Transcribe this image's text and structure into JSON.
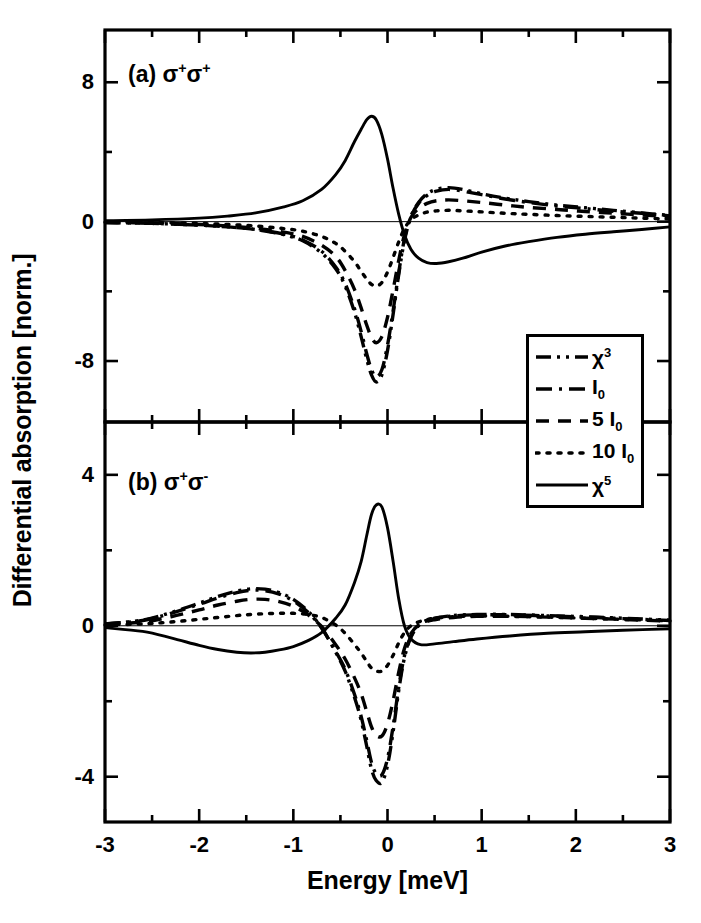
{
  "figure": {
    "ylabel": "Differential absorption [norm.]",
    "xlabel": "Energy [meV]",
    "panel_a_label_prefix": "(a) σ",
    "panel_a_sup1": "+",
    "panel_a_mid": "σ",
    "panel_a_sup2": "+",
    "panel_b_label_prefix": "(b) σ",
    "panel_b_sup1": "+",
    "panel_b_mid": "σ",
    "panel_b_sup2": "-",
    "line_color": "#000000",
    "frame_color": "#000000",
    "background": "#ffffff"
  },
  "legend": {
    "entries": [
      {
        "label_main": "χ",
        "label_sup": "3",
        "label_sub": "",
        "style": "dash-dot-dot"
      },
      {
        "label_main": "I",
        "label_sup": "",
        "label_sub": "0",
        "style": "dash-dot"
      },
      {
        "label_main": "5 I",
        "label_sup": "",
        "label_sub": "0",
        "style": "dashed"
      },
      {
        "label_main": "10 I",
        "label_sup": "",
        "label_sub": "0",
        "style": "dotted"
      },
      {
        "label_main": "χ",
        "label_sup": "5",
        "label_sub": "",
        "style": "solid"
      }
    ]
  },
  "chart_data": {
    "type": "line",
    "title": "",
    "xlabel": "Energy [meV]",
    "ylabel": "Differential absorption [norm.]",
    "xlim": [
      -3,
      3
    ],
    "xticks": [
      -3,
      -2,
      -1,
      0,
      1,
      2,
      3
    ],
    "xticklabels": [
      "-3",
      "-2",
      "-1",
      "0",
      "1",
      "2",
      "3"
    ],
    "x_minor_ticks": [
      -2.5,
      -1.5,
      -0.5,
      0.5,
      1.5,
      2.5
    ],
    "grid": false,
    "legend_position": "center-right",
    "panels": [
      {
        "id": "a",
        "label": "(a) σ+σ+",
        "ylim": [
          -11.5,
          11.0
        ],
        "yticks": [
          8,
          0,
          -8
        ],
        "yticklabels": [
          "8",
          "0",
          "-8"
        ],
        "y_minor_ticks": [
          4,
          -4
        ],
        "series": [
          {
            "name": "χ³",
            "style": "dash-dot-dot",
            "x": [
              -3.0,
              -2.5,
              -2.0,
              -1.7,
              -1.4,
              -1.1,
              -0.9,
              -0.7,
              -0.55,
              -0.45,
              -0.35,
              -0.28,
              -0.22,
              -0.17,
              -0.12,
              -0.06,
              0.0,
              0.06,
              0.12,
              0.18,
              0.25,
              0.33,
              0.42,
              0.52,
              0.65,
              0.8,
              1.0,
              1.25,
              1.5,
              1.8,
              2.1,
              2.4,
              2.7,
              3.0
            ],
            "y": [
              -0.05,
              -0.1,
              -0.2,
              -0.3,
              -0.45,
              -0.75,
              -1.1,
              -1.8,
              -2.7,
              -3.7,
              -5.2,
              -6.6,
              -7.9,
              -8.8,
              -9.2,
              -8.8,
              -7.4,
              -5.3,
              -3.0,
              -1.1,
              0.3,
              1.1,
              1.6,
              1.85,
              1.95,
              1.85,
              1.6,
              1.35,
              1.15,
              0.95,
              0.8,
              0.65,
              0.5,
              0.35
            ]
          },
          {
            "name": "I₀",
            "style": "dash-dot",
            "x": [
              -3.0,
              -2.5,
              -2.0,
              -1.7,
              -1.4,
              -1.1,
              -0.9,
              -0.7,
              -0.55,
              -0.45,
              -0.35,
              -0.28,
              -0.22,
              -0.17,
              -0.12,
              -0.06,
              0.0,
              0.06,
              0.12,
              0.18,
              0.25,
              0.33,
              0.42,
              0.52,
              0.65,
              0.8,
              1.0,
              1.25,
              1.5,
              1.8,
              2.1,
              2.4,
              2.7,
              3.0
            ],
            "y": [
              -0.05,
              -0.1,
              -0.2,
              -0.3,
              -0.45,
              -0.72,
              -1.05,
              -1.7,
              -2.6,
              -3.55,
              -5.0,
              -6.3,
              -7.6,
              -8.5,
              -8.9,
              -8.5,
              -7.1,
              -5.1,
              -2.9,
              -1.0,
              0.3,
              1.05,
              1.5,
              1.75,
              1.85,
              1.75,
              1.55,
              1.3,
              1.1,
              0.9,
              0.75,
              0.6,
              0.48,
              0.33
            ]
          },
          {
            "name": "5 I₀",
            "style": "dashed",
            "x": [
              -3.0,
              -2.5,
              -2.0,
              -1.7,
              -1.4,
              -1.1,
              -0.9,
              -0.7,
              -0.55,
              -0.45,
              -0.35,
              -0.28,
              -0.22,
              -0.17,
              -0.12,
              -0.06,
              0.0,
              0.06,
              0.12,
              0.18,
              0.25,
              0.33,
              0.42,
              0.52,
              0.65,
              0.8,
              1.0,
              1.25,
              1.5,
              1.8,
              2.1,
              2.4,
              2.7,
              3.0
            ],
            "y": [
              -0.04,
              -0.08,
              -0.16,
              -0.25,
              -0.38,
              -0.6,
              -0.85,
              -1.35,
              -2.0,
              -2.8,
              -3.9,
              -4.95,
              -5.95,
              -6.65,
              -6.95,
              -6.6,
              -5.5,
              -3.9,
              -2.2,
              -0.75,
              0.25,
              0.75,
              1.05,
              1.2,
              1.25,
              1.2,
              1.1,
              0.95,
              0.82,
              0.7,
              0.58,
              0.48,
              0.38,
              0.28
            ]
          },
          {
            "name": "10 I₀",
            "style": "dotted",
            "x": [
              -3.0,
              -2.5,
              -2.0,
              -1.7,
              -1.4,
              -1.1,
              -0.9,
              -0.7,
              -0.55,
              -0.45,
              -0.35,
              -0.28,
              -0.22,
              -0.17,
              -0.12,
              -0.06,
              0.0,
              0.06,
              0.12,
              0.18,
              0.25,
              0.33,
              0.42,
              0.52,
              0.65,
              0.8,
              1.0,
              1.25,
              1.5,
              1.8,
              2.1,
              2.4,
              2.7,
              3.0
            ],
            "y": [
              -0.03,
              -0.05,
              -0.1,
              -0.16,
              -0.25,
              -0.4,
              -0.55,
              -0.85,
              -1.25,
              -1.7,
              -2.3,
              -2.85,
              -3.3,
              -3.6,
              -3.7,
              -3.5,
              -2.9,
              -2.05,
              -1.15,
              -0.4,
              0.12,
              0.38,
              0.55,
              0.62,
              0.65,
              0.62,
              0.56,
              0.48,
              0.42,
              0.35,
              0.3,
              0.25,
              0.2,
              0.15
            ]
          },
          {
            "name": "χ⁵",
            "style": "solid",
            "x": [
              -3.0,
              -2.5,
              -2.0,
              -1.7,
              -1.4,
              -1.1,
              -0.9,
              -0.7,
              -0.55,
              -0.45,
              -0.35,
              -0.28,
              -0.22,
              -0.17,
              -0.12,
              -0.06,
              0.0,
              0.06,
              0.12,
              0.18,
              0.25,
              0.33,
              0.42,
              0.52,
              0.65,
              0.8,
              1.0,
              1.25,
              1.5,
              1.8,
              2.1,
              2.4,
              2.7,
              3.0
            ],
            "y": [
              0.05,
              0.1,
              0.2,
              0.32,
              0.5,
              0.85,
              1.2,
              1.85,
              2.7,
              3.5,
              4.6,
              5.3,
              5.85,
              6.05,
              5.85,
              5.0,
              3.6,
              1.9,
              0.4,
              -0.75,
              -1.6,
              -2.1,
              -2.35,
              -2.4,
              -2.3,
              -2.1,
              -1.75,
              -1.4,
              -1.15,
              -0.9,
              -0.72,
              -0.58,
              -0.45,
              -0.3
            ]
          }
        ]
      },
      {
        "id": "b",
        "label": "(b) σ+σ-",
        "ylim": [
          -5.2,
          5.4
        ],
        "yticks": [
          4,
          0,
          -4
        ],
        "yticklabels": [
          "4",
          "0",
          "-4"
        ],
        "y_minor_ticks": [
          2,
          -2
        ],
        "series": [
          {
            "name": "χ³",
            "style": "dash-dot-dot",
            "x": [
              -3.0,
              -2.6,
              -2.3,
              -2.0,
              -1.8,
              -1.6,
              -1.45,
              -1.3,
              -1.15,
              -1.0,
              -0.85,
              -0.7,
              -0.55,
              -0.45,
              -0.35,
              -0.28,
              -0.22,
              -0.17,
              -0.12,
              -0.06,
              0.0,
              0.06,
              0.12,
              0.18,
              0.25,
              0.35,
              0.5,
              0.7,
              0.95,
              1.3,
              1.7,
              2.1,
              2.5,
              3.0
            ],
            "y": [
              0.05,
              0.15,
              0.35,
              0.6,
              0.78,
              0.92,
              0.98,
              0.97,
              0.88,
              0.7,
              0.4,
              -0.05,
              -0.7,
              -1.2,
              -1.9,
              -2.5,
              -3.2,
              -3.8,
              -4.1,
              -4.15,
              -3.7,
              -2.8,
              -1.7,
              -0.85,
              -0.3,
              0.05,
              0.2,
              0.27,
              0.3,
              0.3,
              0.27,
              0.24,
              0.2,
              0.15
            ]
          },
          {
            "name": "I₀",
            "style": "dash-dot",
            "x": [
              -3.0,
              -2.6,
              -2.3,
              -2.0,
              -1.8,
              -1.6,
              -1.45,
              -1.3,
              -1.15,
              -1.0,
              -0.85,
              -0.7,
              -0.55,
              -0.45,
              -0.35,
              -0.28,
              -0.22,
              -0.17,
              -0.12,
              -0.06,
              0.0,
              0.06,
              0.12,
              0.18,
              0.25,
              0.35,
              0.5,
              0.7,
              0.95,
              1.3,
              1.7,
              2.1,
              2.5,
              3.0
            ],
            "y": [
              0.05,
              0.14,
              0.33,
              0.57,
              0.74,
              0.88,
              0.94,
              0.93,
              0.84,
              0.66,
              0.37,
              -0.06,
              -0.68,
              -1.15,
              -1.82,
              -2.4,
              -3.05,
              -3.62,
              -3.92,
              -3.95,
              -3.52,
              -2.66,
              -1.62,
              -0.8,
              -0.28,
              0.05,
              0.19,
              0.26,
              0.29,
              0.29,
              0.26,
              0.23,
              0.19,
              0.14
            ]
          },
          {
            "name": "5 I₀",
            "style": "dashed",
            "x": [
              -3.0,
              -2.6,
              -2.3,
              -2.0,
              -1.8,
              -1.6,
              -1.45,
              -1.3,
              -1.15,
              -1.0,
              -0.85,
              -0.7,
              -0.55,
              -0.45,
              -0.35,
              -0.28,
              -0.22,
              -0.17,
              -0.12,
              -0.06,
              0.0,
              0.06,
              0.12,
              0.18,
              0.25,
              0.35,
              0.5,
              0.7,
              0.95,
              1.3,
              1.7,
              2.1,
              2.5,
              3.0
            ],
            "y": [
              0.04,
              0.1,
              0.24,
              0.42,
              0.55,
              0.65,
              0.7,
              0.7,
              0.64,
              0.52,
              0.3,
              -0.02,
              -0.5,
              -0.88,
              -1.38,
              -1.8,
              -2.28,
              -2.68,
              -2.9,
              -2.92,
              -2.6,
              -1.98,
              -1.22,
              -0.6,
              -0.2,
              0.05,
              0.16,
              0.22,
              0.25,
              0.25,
              0.23,
              0.2,
              0.17,
              0.12
            ]
          },
          {
            "name": "10 I₀",
            "style": "dotted",
            "x": [
              -3.0,
              -2.6,
              -2.3,
              -2.0,
              -1.8,
              -1.6,
              -1.45,
              -1.3,
              -1.15,
              -1.0,
              -0.85,
              -0.7,
              -0.55,
              -0.45,
              -0.35,
              -0.28,
              -0.22,
              -0.17,
              -0.12,
              -0.06,
              0.0,
              0.06,
              0.12,
              0.18,
              0.25,
              0.35,
              0.5,
              0.7,
              0.95,
              1.3,
              1.7,
              2.1,
              2.5,
              3.0
            ],
            "y": [
              0.02,
              0.05,
              0.1,
              0.17,
              0.22,
              0.27,
              0.3,
              0.32,
              0.33,
              0.33,
              0.3,
              0.22,
              0.02,
              -0.2,
              -0.5,
              -0.72,
              -0.95,
              -1.12,
              -1.2,
              -1.2,
              -1.05,
              -0.78,
              -0.45,
              -0.18,
              0.0,
              0.12,
              0.2,
              0.24,
              0.26,
              0.25,
              0.23,
              0.2,
              0.17,
              0.13
            ]
          },
          {
            "name": "χ⁵",
            "style": "solid",
            "x": [
              -3.0,
              -2.6,
              -2.3,
              -2.0,
              -1.8,
              -1.6,
              -1.45,
              -1.3,
              -1.15,
              -1.0,
              -0.85,
              -0.7,
              -0.55,
              -0.45,
              -0.35,
              -0.28,
              -0.22,
              -0.17,
              -0.12,
              -0.06,
              0.0,
              0.06,
              0.12,
              0.18,
              0.25,
              0.35,
              0.5,
              0.7,
              0.95,
              1.3,
              1.7,
              2.1,
              2.5,
              3.0
            ],
            "y": [
              -0.05,
              -0.15,
              -0.32,
              -0.52,
              -0.63,
              -0.7,
              -0.72,
              -0.7,
              -0.64,
              -0.55,
              -0.4,
              -0.18,
              0.2,
              0.55,
              1.15,
              1.7,
              2.4,
              2.95,
              3.2,
              3.15,
              2.6,
              1.7,
              0.7,
              0.0,
              -0.35,
              -0.5,
              -0.48,
              -0.42,
              -0.35,
              -0.27,
              -0.2,
              -0.16,
              -0.12,
              -0.08
            ]
          }
        ]
      }
    ]
  },
  "axes_geometry": {
    "plot_left_px": 105,
    "plot_right_px": 670,
    "panel_a_top_px": 30,
    "panel_a_bottom_px": 422,
    "panel_b_top_px": 422,
    "panel_b_bottom_px": 822
  }
}
